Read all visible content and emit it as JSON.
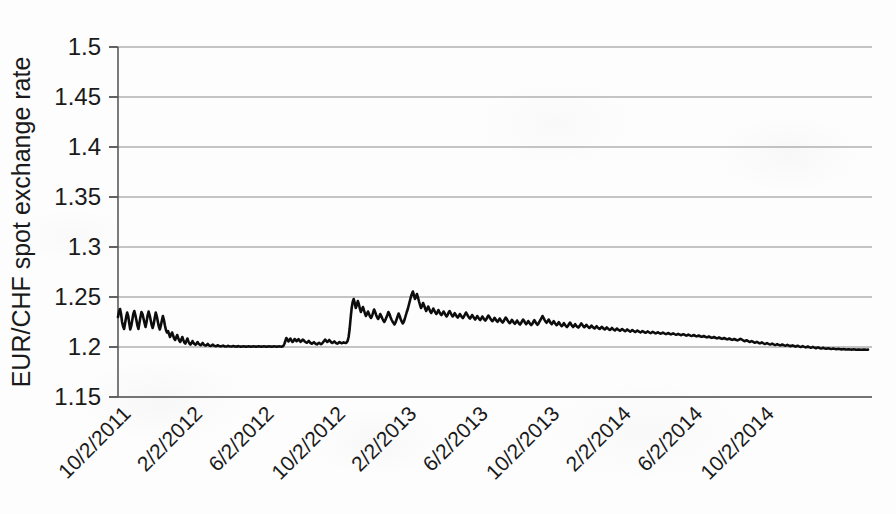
{
  "chart_data": {
    "type": "line",
    "title": "",
    "xlabel": "",
    "ylabel": "EUR/CHF spot exchange rate",
    "ylim": [
      1.15,
      1.5
    ],
    "yticks": [
      "1.15",
      "1.2",
      "1.25",
      "1.3",
      "1.35",
      "1.4",
      "1.45",
      "1.5"
    ],
    "ytick_values": [
      1.15,
      1.2,
      1.25,
      1.3,
      1.35,
      1.4,
      1.45,
      1.5
    ],
    "xticks": [
      "10/2/2011",
      "2/2/2012",
      "6/2/2012",
      "10/2/2012",
      "2/2/2013",
      "6/2/2013",
      "10/2/2013",
      "2/2/2014",
      "6/2/2014",
      "10/2/2014"
    ],
    "grid": "horizontal",
    "legend": "none",
    "line_color": "#0d0d0d",
    "series": [
      {
        "name": "EUR/CHF spot exchange rate",
        "x_start": "10/2/2011",
        "x_end": "12/2/2014",
        "values": [
          1.23,
          1.2355,
          1.238,
          1.233,
          1.225,
          1.2205,
          1.218,
          1.224,
          1.23,
          1.2345,
          1.231,
          1.224,
          1.2175,
          1.221,
          1.227,
          1.233,
          1.236,
          1.232,
          1.227,
          1.2215,
          1.218,
          1.224,
          1.23,
          1.235,
          1.233,
          1.2285,
          1.224,
          1.22,
          1.225,
          1.2315,
          1.2355,
          1.232,
          1.227,
          1.222,
          1.219,
          1.223,
          1.229,
          1.2345,
          1.231,
          1.2255,
          1.2205,
          1.2175,
          1.2215,
          1.2265,
          1.231,
          1.227,
          1.2215,
          1.217,
          1.2145,
          1.216,
          1.213,
          1.21,
          1.212,
          1.2145,
          1.2115,
          1.2085,
          1.207,
          1.2095,
          1.212,
          1.209,
          1.2065,
          1.205,
          1.2075,
          1.21,
          1.207,
          1.2045,
          1.2035,
          1.206,
          1.2085,
          1.2055,
          1.2035,
          1.2025,
          1.204,
          1.206,
          1.204,
          1.203,
          1.2022,
          1.2035,
          1.205,
          1.2032,
          1.2024,
          1.2018,
          1.2028,
          1.204,
          1.2026,
          1.2018,
          1.2014,
          1.202,
          1.203,
          1.2018,
          1.2012,
          1.201,
          1.2016,
          1.2024,
          1.2014,
          1.201,
          1.2008,
          1.2012,
          1.2018,
          1.201,
          1.2008,
          1.2006,
          1.201,
          1.2014,
          1.2008,
          1.2006,
          1.2005,
          1.2008,
          1.2012,
          1.2007,
          1.2005,
          1.2005,
          1.2006,
          1.201,
          1.2006,
          1.2005,
          1.2004,
          1.2006,
          1.2009,
          1.2005,
          1.2004,
          1.2004,
          1.2005,
          1.2008,
          1.2005,
          1.2004,
          1.2004,
          1.2005,
          1.2007,
          1.2005,
          1.2004,
          1.2004,
          1.2005,
          1.2007,
          1.2005,
          1.2004,
          1.2004,
          1.2005,
          1.2007,
          1.2005,
          1.2004,
          1.2004,
          1.2005,
          1.2006,
          1.2005,
          1.2004,
          1.2004,
          1.2005,
          1.2006,
          1.2005,
          1.2004,
          1.2004,
          1.2005,
          1.2006,
          1.2005,
          1.2004,
          1.2004,
          1.2005,
          1.2006,
          1.2005,
          1.2004,
          1.2005,
          1.201,
          1.203,
          1.206,
          1.209,
          1.2075,
          1.2055,
          1.207,
          1.2085,
          1.2065,
          1.205,
          1.206,
          1.208,
          1.2072,
          1.2058,
          1.2066,
          1.2078,
          1.2064,
          1.2052,
          1.206,
          1.2074,
          1.2068,
          1.2055,
          1.2048,
          1.2042,
          1.205,
          1.206,
          1.2048,
          1.2038,
          1.2032,
          1.204,
          1.2048,
          1.2038,
          1.203,
          1.2026,
          1.2034,
          1.2042,
          1.2034,
          1.2028,
          1.2035,
          1.2048,
          1.206,
          1.2075,
          1.2062,
          1.205,
          1.2058,
          1.207,
          1.2058,
          1.2046,
          1.204,
          1.2048,
          1.2056,
          1.2046,
          1.2038,
          1.2034,
          1.204,
          1.205,
          1.2044,
          1.2038,
          1.204,
          1.2046,
          1.2042,
          1.204,
          1.2045,
          1.206,
          1.21,
          1.218,
          1.229,
          1.239,
          1.245,
          1.248,
          1.244,
          1.239,
          1.242,
          1.246,
          1.243,
          1.2385,
          1.235,
          1.2375,
          1.24,
          1.237,
          1.2335,
          1.231,
          1.233,
          1.2355,
          1.233,
          1.2305,
          1.229,
          1.231,
          1.2345,
          1.2375,
          1.235,
          1.232,
          1.2295,
          1.228,
          1.23,
          1.233,
          1.231,
          1.2285,
          1.2265,
          1.225,
          1.227,
          1.2295,
          1.232,
          1.235,
          1.233,
          1.23,
          1.2275,
          1.2255,
          1.224,
          1.2225,
          1.2245,
          1.2275,
          1.2305,
          1.2335,
          1.231,
          1.228,
          1.2255,
          1.2235,
          1.225,
          1.228,
          1.2315,
          1.235,
          1.238,
          1.242,
          1.246,
          1.25,
          1.253,
          1.2555,
          1.252,
          1.248,
          1.25,
          1.253,
          1.2495,
          1.2455,
          1.242,
          1.239,
          1.241,
          1.244,
          1.2415,
          1.2385,
          1.236,
          1.238,
          1.2405,
          1.238,
          1.2355,
          1.234,
          1.236,
          1.2385,
          1.2365,
          1.2345,
          1.233,
          1.2345,
          1.237,
          1.235,
          1.233,
          1.232,
          1.2335,
          1.2355,
          1.234,
          1.232,
          1.2305,
          1.232,
          1.2345,
          1.236,
          1.234,
          1.232,
          1.2305,
          1.2318,
          1.2338,
          1.2322,
          1.2305,
          1.2295,
          1.231,
          1.233,
          1.2315,
          1.23,
          1.229,
          1.2305,
          1.2325,
          1.2345,
          1.2328,
          1.231,
          1.2295,
          1.2285,
          1.23,
          1.232,
          1.2305,
          1.2288,
          1.2275,
          1.229,
          1.231,
          1.2295,
          1.228,
          1.227,
          1.2285,
          1.2305,
          1.229,
          1.2275,
          1.2265,
          1.2278,
          1.2298,
          1.2315,
          1.23,
          1.2282,
          1.2268,
          1.2258,
          1.2272,
          1.2292,
          1.2278,
          1.2262,
          1.2252,
          1.2266,
          1.2285,
          1.227,
          1.2255,
          1.2245,
          1.2258,
          1.2278,
          1.2295,
          1.228,
          1.2262,
          1.2248,
          1.2238,
          1.2252,
          1.2272,
          1.2258,
          1.2242,
          1.2232,
          1.2245,
          1.2265,
          1.225,
          1.2235,
          1.2225,
          1.2238,
          1.2258,
          1.2275,
          1.226,
          1.2242,
          1.2228,
          1.224,
          1.226,
          1.2245,
          1.223,
          1.222,
          1.2232,
          1.2252,
          1.2268,
          1.2252,
          1.2235,
          1.2222,
          1.2234,
          1.2254,
          1.227,
          1.229,
          1.231,
          1.2292,
          1.2272,
          1.2255,
          1.2242,
          1.2255,
          1.2275,
          1.2258,
          1.224,
          1.2228,
          1.224,
          1.2258,
          1.2242,
          1.2228,
          1.2218,
          1.223,
          1.2248,
          1.2232,
          1.2218,
          1.2208,
          1.222,
          1.2238,
          1.2222,
          1.221,
          1.22,
          1.2212,
          1.223,
          1.2245,
          1.2228,
          1.2212,
          1.22,
          1.2212,
          1.2228,
          1.2214,
          1.2202,
          1.2194,
          1.2205,
          1.222,
          1.2236,
          1.2222,
          1.2208,
          1.2198,
          1.2208,
          1.2222,
          1.221,
          1.2198,
          1.219,
          1.22,
          1.2214,
          1.2202,
          1.2192,
          1.2185,
          1.2195,
          1.2208,
          1.2196,
          1.2186,
          1.218,
          1.219,
          1.2202,
          1.2192,
          1.2182,
          1.2176,
          1.2184,
          1.2196,
          1.2186,
          1.2176,
          1.217,
          1.2178,
          1.219,
          1.218,
          1.2172,
          1.2166,
          1.2174,
          1.2185,
          1.2176,
          1.2168,
          1.2162,
          1.217,
          1.218,
          1.2172,
          1.2164,
          1.2158,
          1.2166,
          1.2176,
          1.2168,
          1.216,
          1.2154,
          1.216,
          1.217,
          1.2162,
          1.2155,
          1.215,
          1.2156,
          1.2165,
          1.2158,
          1.2151,
          1.2146,
          1.2152,
          1.216,
          1.2153,
          1.2147,
          1.2142,
          1.2148,
          1.2156,
          1.215,
          1.2144,
          1.2139,
          1.2145,
          1.2152,
          1.2146,
          1.214,
          1.2136,
          1.2141,
          1.2148,
          1.2142,
          1.2137,
          1.2133,
          1.2138,
          1.2144,
          1.2138,
          1.2133,
          1.2129,
          1.2134,
          1.214,
          1.2135,
          1.213,
          1.2126,
          1.2131,
          1.2136,
          1.2131,
          1.2126,
          1.2122,
          1.2127,
          1.2132,
          1.2127,
          1.2122,
          1.2118,
          1.2123,
          1.2128,
          1.2123,
          1.2118,
          1.2114,
          1.2118,
          1.2124,
          1.2119,
          1.2114,
          1.211,
          1.2114,
          1.212,
          1.2115,
          1.211,
          1.2106,
          1.211,
          1.2115,
          1.211,
          1.2105,
          1.2101,
          1.2105,
          1.211,
          1.2105,
          1.21,
          1.2096,
          1.21,
          1.2105,
          1.21,
          1.2095,
          1.2091,
          1.2095,
          1.21,
          1.2095,
          1.209,
          1.2086,
          1.209,
          1.2095,
          1.209,
          1.2085,
          1.2081,
          1.2085,
          1.209,
          1.2085,
          1.208,
          1.2076,
          1.208,
          1.2085,
          1.208,
          1.2075,
          1.2071,
          1.2075,
          1.208,
          1.2075,
          1.207,
          1.2066,
          1.207,
          1.2076,
          1.2082,
          1.2076,
          1.207,
          1.2064,
          1.2058,
          1.2062,
          1.2068,
          1.2062,
          1.2056,
          1.205,
          1.2054,
          1.206,
          1.2054,
          1.2048,
          1.2042,
          1.2046,
          1.2052,
          1.2046,
          1.204,
          1.2036,
          1.204,
          1.2046,
          1.204,
          1.2034,
          1.203,
          1.2034,
          1.204,
          1.2034,
          1.2029,
          1.2025,
          1.2029,
          1.2034,
          1.2029,
          1.2024,
          1.202,
          1.2024,
          1.2029,
          1.2024,
          1.202,
          1.2016,
          1.202,
          1.2025,
          1.202,
          1.2016,
          1.2012,
          1.2016,
          1.2021,
          1.2016,
          1.2012,
          1.2008,
          1.2012,
          1.2017,
          1.2012,
          1.2008,
          1.2004,
          1.2008,
          1.2013,
          1.2008,
          1.2004,
          1.2,
          1.2004,
          1.2009,
          1.2004,
          1.2,
          1.1996,
          1.2,
          1.2005,
          1.2,
          1.1996,
          1.1992,
          1.1996,
          1.2001,
          1.1996,
          1.1992,
          1.1988,
          1.1992,
          1.1996,
          1.1992,
          1.1988,
          1.1985,
          1.1988,
          1.1992,
          1.1988,
          1.1985,
          1.1982,
          1.1985,
          1.1988,
          1.1985,
          1.1982,
          1.198,
          1.1982,
          1.1985,
          1.1982,
          1.198,
          1.1978,
          1.198,
          1.1982,
          1.198,
          1.1978,
          1.1976,
          1.1978,
          1.198,
          1.1978,
          1.1976,
          1.1975,
          1.1976,
          1.1978,
          1.1976,
          1.1975,
          1.1974,
          1.1975,
          1.1976,
          1.1975,
          1.1974,
          1.1973,
          1.1974,
          1.1975,
          1.1974,
          1.1973,
          1.1973,
          1.1974,
          1.1975,
          1.1974,
          1.1973,
          1.1973,
          1.1974
        ]
      }
    ]
  },
  "axis": {
    "y_title": "EUR/CHF spot exchange rate"
  }
}
